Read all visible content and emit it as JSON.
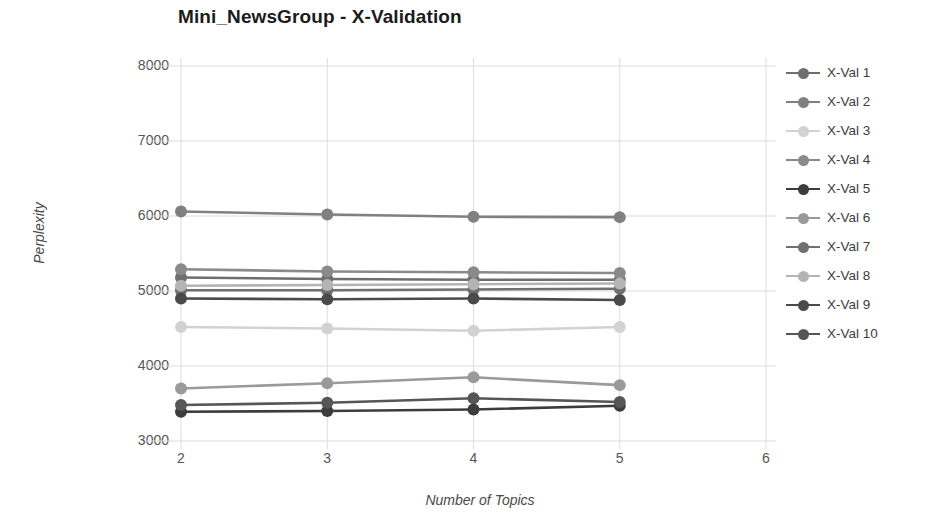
{
  "chart_data": {
    "type": "line",
    "title": "Mini_NewsGroup - X-Validation",
    "xlabel": "Number of Topics",
    "ylabel": "Perplexity",
    "grid": true,
    "legend_position": "right",
    "x": [
      2,
      3,
      4,
      5
    ],
    "xlim": [
      2,
      6
    ],
    "ylim": [
      3000,
      8000
    ],
    "xticks": [
      "2",
      "3",
      "4",
      "5",
      "6"
    ],
    "yticks": [
      "8000",
      "7000",
      "6000",
      "5000",
      "4000",
      "3000"
    ],
    "series": [
      {
        "name": "X-Val 1",
        "color": "#6e6e6e",
        "values": [
          5180,
          5160,
          5150,
          5150
        ]
      },
      {
        "name": "X-Val 2",
        "color": "#808080",
        "values": [
          6060,
          6020,
          5990,
          5985
        ]
      },
      {
        "name": "X-Val 3",
        "color": "#d2d2d2",
        "values": [
          4520,
          4500,
          4470,
          4520
        ]
      },
      {
        "name": "X-Val 4",
        "color": "#8a8a8a",
        "values": [
          5290,
          5260,
          5250,
          5240
        ]
      },
      {
        "name": "X-Val 5",
        "color": "#3c3c3c",
        "values": [
          3390,
          3400,
          3420,
          3470
        ]
      },
      {
        "name": "X-Val 6",
        "color": "#9a9a9a",
        "values": [
          3700,
          3770,
          3850,
          3745
        ]
      },
      {
        "name": "X-Val 7",
        "color": "#707070",
        "values": [
          5010,
          5010,
          5020,
          5030
        ]
      },
      {
        "name": "X-Val 8",
        "color": "#b4b4b4",
        "values": [
          5070,
          5080,
          5090,
          5100
        ]
      },
      {
        "name": "X-Val 9",
        "color": "#4a4a4a",
        "values": [
          4900,
          4890,
          4900,
          4880
        ]
      },
      {
        "name": "X-Val 10",
        "color": "#565656",
        "values": [
          3480,
          3510,
          3570,
          3520
        ]
      }
    ]
  }
}
